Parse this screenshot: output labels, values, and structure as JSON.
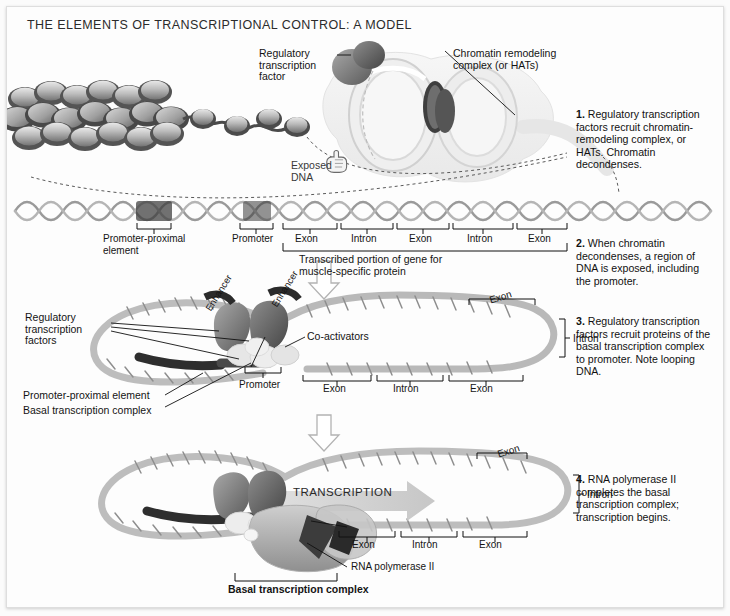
{
  "figure": {
    "title": "THE ELEMENTS OF TRANSCRIPTIONAL CONTROL: A MODEL",
    "background_color": "#fdfdfd",
    "border_color": "#dedede",
    "text_color": "#141414"
  },
  "steps": [
    {
      "number": "1.",
      "text": "Regulatory transcription factors recruit chromatin-remodeling complex, or HATs. Chromatin decondenses."
    },
    {
      "number": "2.",
      "text": "When chromatin decondenses, a region of DNA is exposed, including the promoter."
    },
    {
      "number": "3.",
      "text": "Regulatory transcription factors recruit proteins of the basal transcription complex to promoter. Note looping DNA."
    },
    {
      "number": "4.",
      "text": "RNA polymerase II completes the basal transcription complex; transcription begins."
    }
  ],
  "panel1": {
    "label_regulatory_factor": "Regulatory\ntranscription\nfactor",
    "label_chromatin_complex": "Chromatin remodeling\ncomplex (or HATs)",
    "label_exposed_dna": "Exposed\nDNA",
    "pointer_icon": "pointing-hand-icon"
  },
  "panel2": {
    "gene_map": [
      "Promoter-proximal\nelement",
      "Promoter",
      "Exon",
      "Intron",
      "Exon",
      "Intron",
      "Exon"
    ],
    "transcribed_caption": "Transcribed portion of gene for\nmuscle-specific protein"
  },
  "panel3": {
    "label_reg_factors": "Regulatory\ntranscription\nfactors",
    "label_enhancer_1": "Enhancer",
    "label_enhancer_2": "Enhancer",
    "label_coactivators": "Co-activators",
    "label_promoter": "Promoter",
    "label_promoter_proximal": "Promoter-proximal element",
    "label_basal_complex": "Basal transcription complex",
    "loop_labels": {
      "exon_top": "Exon",
      "intron_right": "Intron",
      "exon_left": "Exon",
      "intron_bottom": "Intron",
      "exon_bottom": "Exon"
    }
  },
  "panel4": {
    "label_transcription": "TRANSCRIPTION",
    "label_rna_pol": "RNA polymerase II",
    "label_basal_complex": "Basal transcription complex",
    "loop_labels": {
      "exon_top": "Exon",
      "intron_right": "Intron",
      "exon_left": "Exon",
      "intron_bottom": "Intron",
      "exon_bottom": "Exon"
    }
  }
}
